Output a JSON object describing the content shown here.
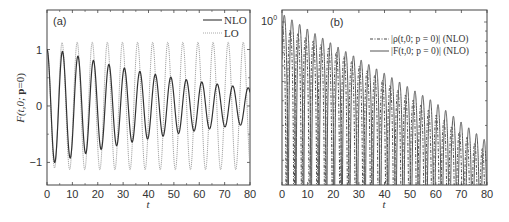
{
  "chart_data": [
    {
      "type": "line",
      "panel_label": "(a)",
      "title": "",
      "xlabel": "t",
      "ylabel": "F(t,0; p=0)",
      "xlim": [
        0,
        80
      ],
      "ylim": [
        -1.4,
        1.7
      ],
      "xticks": [
        0,
        10,
        20,
        30,
        40,
        50,
        60,
        70,
        80
      ],
      "yticks": [
        -1,
        0,
        1
      ],
      "legend_position": "upper right",
      "series": [
        {
          "name": "NLO",
          "style": "solid",
          "color": "#333333",
          "model": "damped_cos",
          "amplitude": 1.05,
          "period": 6.1,
          "decay_rate": 0.015,
          "peak_samples": {
            "t": [
              0,
              6,
              12,
              18,
              24,
              30,
              36,
              42,
              48,
              54,
              60,
              66,
              72,
              78
            ],
            "F": [
              1.0,
              1.05,
              0.97,
              0.9,
              0.82,
              0.75,
              0.69,
              0.62,
              0.57,
              0.52,
              0.47,
              0.42,
              0.39,
              0.35
            ]
          }
        },
        {
          "name": "LO",
          "style": "dotted",
          "color": "#999999",
          "model": "cos",
          "amplitude": 1.13,
          "period": 5.95
        }
      ]
    },
    {
      "type": "line",
      "panel_label": "(b)",
      "title": "",
      "xlabel": "t",
      "ylabel": "",
      "xlim": [
        0,
        80
      ],
      "ylim": [
        0.15,
        1.15
      ],
      "yscale": "log",
      "xticks": [
        0,
        10,
        20,
        30,
        40,
        50,
        60,
        70,
        80
      ],
      "yticks_labels": [
        "10^0"
      ],
      "legend_position": "upper right",
      "series": [
        {
          "name": "|ρ(t,0; p=0)| (NLO)",
          "style": "dash-dot",
          "color": "#333333",
          "envelope_t": [
            0,
            20,
            40,
            60,
            80
          ],
          "envelope": [
            0.95,
            0.72,
            0.5,
            0.34,
            0.22
          ]
        },
        {
          "name": "|F(t,0; p=0)| (NLO)",
          "style": "solid",
          "color": "#555555",
          "envelope_t": [
            1,
            20,
            40,
            60,
            78
          ],
          "envelope": [
            1.08,
            0.77,
            0.55,
            0.39,
            0.26
          ]
        }
      ]
    }
  ],
  "panels": {
    "a": {
      "label": "(a)",
      "xlabel": "t",
      "ylabel_main": "F",
      "ylabel_args": "(t,0; ",
      "ylabel_bold": "p",
      "ylabel_end": "=0)",
      "legend": [
        "NLO",
        "LO"
      ],
      "xticks": [
        "0",
        "10",
        "20",
        "30",
        "40",
        "50",
        "60",
        "70",
        "80"
      ],
      "yticks": [
        "1",
        "0",
        "−1"
      ]
    },
    "b": {
      "label": "(b)",
      "xlabel": "t",
      "ytick_base": "10",
      "ytick_exp": "0",
      "legend": [
        "|ρ(t,0; p = 0)|  (NLO)",
        "|F(t,0; p = 0)|  (NLO)"
      ],
      "xticks": [
        "0",
        "10",
        "20",
        "30",
        "40",
        "50",
        "60",
        "70",
        "80"
      ]
    }
  }
}
